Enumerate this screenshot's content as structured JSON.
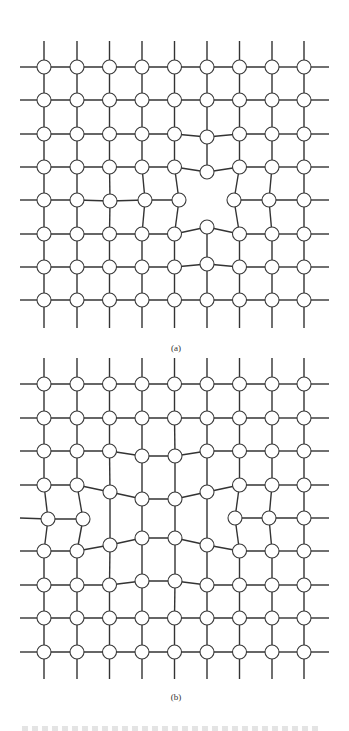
{
  "figure": {
    "line_color": "#333333",
    "node_stroke": "#3a3a3a",
    "node_fill": "#ffffff",
    "node_radius": 7,
    "columns_x": [
      44,
      77,
      109.5,
      142,
      174.5,
      207,
      239.5,
      272,
      304
    ],
    "grid_extent": {
      "left": 20,
      "right": 329
    }
  },
  "panels": [
    {
      "id": "a",
      "label": "(a)",
      "description": "Square lattice with a single vacancy; neighbouring atoms relax inward",
      "top_line_y": 41,
      "bottom_line_y": 328,
      "rows_y": [
        67,
        100,
        134,
        167,
        200,
        234,
        267,
        300
      ],
      "displaced": {
        "2,5": [
          207,
          137
        ],
        "3,5": [
          207,
          172
        ],
        "4,2": [
          110,
          201
        ],
        "4,3": [
          145,
          200
        ],
        "4,4": [
          179,
          200
        ],
        "4,6": [
          234,
          200
        ],
        "4,7": [
          269,
          200
        ],
        "5,5": [
          207,
          227
        ],
        "6,5": [
          207,
          264
        ]
      },
      "missing": [
        "4,5"
      ],
      "cut_edges": [
        [
          "3,5",
          "4,5"
        ],
        [
          "4,5",
          "5,5"
        ],
        [
          "4,4",
          "4,5"
        ],
        [
          "4,5",
          "4,6"
        ]
      ]
    },
    {
      "id": "b",
      "label": "(b)",
      "description": "Square lattice with a divacancy (two missing atoms in one row); surrounding atoms relax",
      "top_line_y": 358,
      "bottom_line_y": 679,
      "rows_y": [
        384,
        418,
        451,
        485,
        518,
        551,
        585,
        618,
        652
      ],
      "displaced": {
        "2,3": [
          142,
          456
        ],
        "2,4": [
          175,
          456
        ],
        "3,2": [
          110,
          492
        ],
        "3,3": [
          142,
          499
        ],
        "3,4": [
          175,
          499
        ],
        "3,5": [
          207,
          492
        ],
        "4,0": [
          48,
          519
        ],
        "4,1": [
          83,
          519
        ],
        "4,6": [
          235,
          518
        ],
        "4,7": [
          269,
          518
        ],
        "5,2": [
          110,
          545
        ],
        "5,3": [
          142,
          538
        ],
        "5,4": [
          175,
          538
        ],
        "5,5": [
          207,
          545
        ],
        "6,3": [
          142,
          581
        ],
        "6,4": [
          175,
          581
        ]
      },
      "missing": [
        "4,2",
        "4,3",
        "4,4",
        "4,5"
      ],
      "bridge_edges": [
        [
          "3,2",
          "5,2"
        ],
        [
          "3,3",
          "5,3"
        ],
        [
          "3,4",
          "5,4"
        ],
        [
          "3,5",
          "5,5"
        ]
      ],
      "cut_edges": [
        [
          "4,1",
          "4,2"
        ],
        [
          "4,5",
          "4,6"
        ]
      ]
    }
  ],
  "caption": {
    "visible": "cut-off, illegible"
  }
}
